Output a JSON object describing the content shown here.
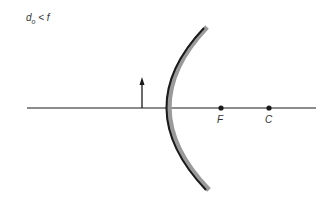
{
  "condition": {
    "var": "d",
    "sub": "o",
    "rest": " < f"
  },
  "points": [
    {
      "label": "F",
      "x": 221
    },
    {
      "label": "C",
      "x": 269
    }
  ],
  "colors": {
    "line": "#1a1a1a",
    "mirror_back": "#999999",
    "mirror_front": "#1a1a1a"
  }
}
